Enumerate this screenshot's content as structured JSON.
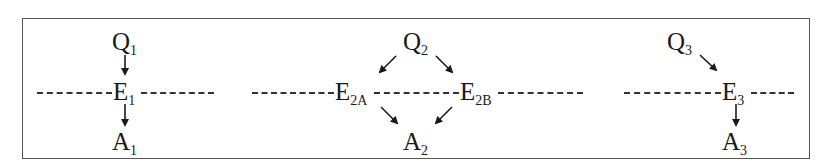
{
  "diagram": {
    "panels": [
      {
        "id": "panel-1",
        "nodes": [
          {
            "label": "Q",
            "sub": "1",
            "x": 112,
            "y": 30
          },
          {
            "label": "E",
            "sub": "1",
            "x": 113,
            "y": 80
          },
          {
            "label": "A",
            "sub": "1",
            "x": 112,
            "y": 130
          }
        ],
        "dashes": [
          {
            "x1": 37,
            "x2": 112,
            "y": 93
          },
          {
            "x1": 141,
            "x2": 214,
            "y": 93
          }
        ],
        "arrows": [
          {
            "from": [
              125,
              55
            ],
            "to": [
              125,
              74
            ]
          },
          {
            "from": [
              125,
              104
            ],
            "to": [
              125,
              125
            ]
          }
        ]
      },
      {
        "id": "panel-2",
        "nodes": [
          {
            "label": "Q",
            "sub": "2",
            "x": 403,
            "y": 30
          },
          {
            "label": "E",
            "sub": "2A",
            "x": 335,
            "y": 80
          },
          {
            "label": "E",
            "sub": "2B",
            "x": 460,
            "y": 80
          },
          {
            "label": "A",
            "sub": "2",
            "x": 403,
            "y": 130
          }
        ],
        "dashes": [
          {
            "x1": 252,
            "x2": 334,
            "y": 93
          },
          {
            "x1": 374,
            "x2": 459,
            "y": 93
          },
          {
            "x1": 498,
            "x2": 583,
            "y": 93
          }
        ],
        "arrows": [
          {
            "from": [
              396,
              56
            ],
            "to": [
              380,
              72
            ]
          },
          {
            "from": [
              436,
              56
            ],
            "to": [
              452,
              72
            ]
          },
          {
            "from": [
              381,
              107
            ],
            "to": [
              397,
              123
            ]
          },
          {
            "from": [
              452,
              107
            ],
            "to": [
              436,
              123
            ]
          }
        ]
      },
      {
        "id": "panel-3",
        "nodes": [
          {
            "label": "Q",
            "sub": "3",
            "x": 667,
            "y": 30
          },
          {
            "label": "E",
            "sub": "3",
            "x": 722,
            "y": 80
          },
          {
            "label": "A",
            "sub": "3",
            "x": 722,
            "y": 130
          }
        ],
        "dashes": [
          {
            "x1": 624,
            "x2": 721,
            "y": 93
          },
          {
            "x1": 751,
            "x2": 794,
            "y": 93
          }
        ],
        "arrows": [
          {
            "from": [
              700,
              55
            ],
            "to": [
              716,
              70
            ]
          },
          {
            "from": [
              736,
              104
            ],
            "to": [
              736,
              125
            ]
          }
        ]
      }
    ],
    "colors": {
      "stroke": "#1a1a1a",
      "frame": "#555555",
      "background": "#ffffff"
    }
  }
}
